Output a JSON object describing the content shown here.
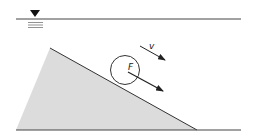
{
  "diagram": {
    "labels": {
      "force": "F",
      "velocity": "v"
    },
    "colors": {
      "background": "#ffffff",
      "stroke": "#333333",
      "slope_fill": "#dcdcdc"
    },
    "elements": {
      "water_surface": "free surface with level marker",
      "slope": "shaded inclined wedge",
      "particle": "circle resting on slope",
      "force_arrow": "arrow from particle center pointing down-slope",
      "velocity_arrow": "arrow above particle pointing down-slope",
      "bed": "horizontal bottom line"
    }
  }
}
